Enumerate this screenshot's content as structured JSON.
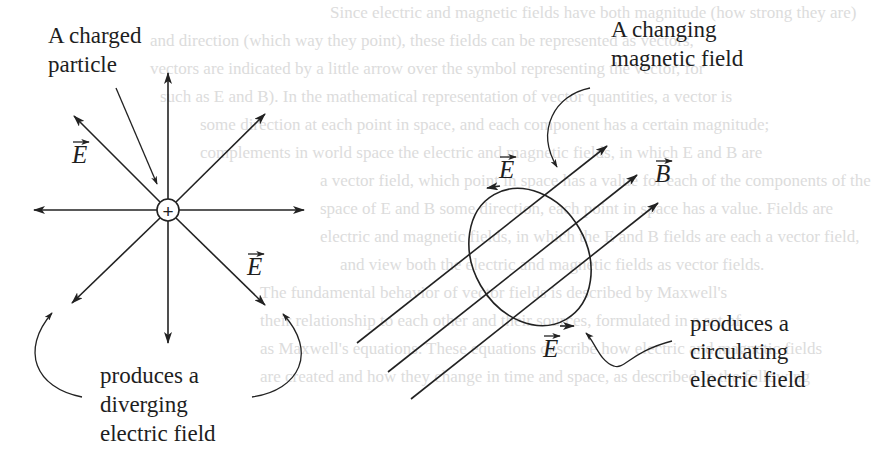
{
  "background_text": [
    "Since electric and magnetic fields have both magnitude (how strong they are)",
    "and direction (which way they point), these fields can be represented as vectors,",
    "vectors are indicated by a little arrow over the symbol representing the vector, for",
    "such as E and B). In the mathematical representation of vector quantities, a vector is",
    "some direction at each point in space, and each component has a certain magnitude;",
    "complements in world space the electric and magnetic fields, in which E and B are",
    "a vector field, which point in space has a value for each of the components of the",
    "space of E and B some direction, each point in space has a value. Fields are",
    "electric and magnetic fields, in which the E and B fields are each a vector field,",
    "and view both the electric and magnetic fields as vector fields.",
    "The fundamental behavior of vector fields is described by Maxwell's",
    "their relationship to each other and their sources, formulated in a set of",
    "as Maxwell's equations. These equations describe how electric and magnetic fields",
    "are created and how they change in time and space, as described in the following"
  ],
  "left_diagram": {
    "label_charged_particle": [
      "A charged",
      "particle"
    ],
    "charge_symbol": "+",
    "vector_label_upper": "E",
    "vector_label_lower": "E",
    "caption": [
      "produces a",
      "diverging",
      "electric field"
    ]
  },
  "right_diagram": {
    "label_changing_field": [
      "A changing",
      "magnetic field"
    ],
    "vector_label_e_upper": "E",
    "vector_label_b": "B",
    "vector_label_e_lower": "E",
    "caption": [
      "produces a",
      "circulating",
      "electric field"
    ]
  }
}
